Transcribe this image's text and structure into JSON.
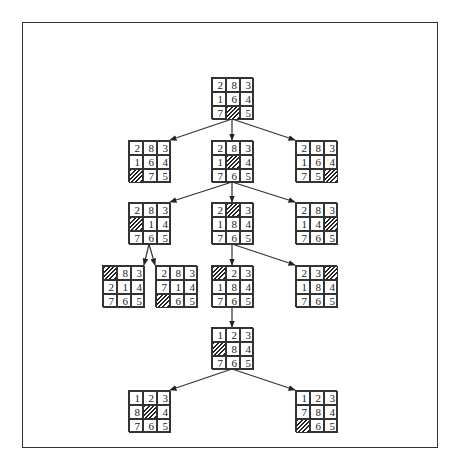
{
  "diagram": {
    "type": "search-tree",
    "blank_marker": "hatched",
    "nodes": [
      {
        "id": "n0",
        "x": 211,
        "y": 77,
        "cells": [
          "2",
          "8",
          "3",
          "1",
          "6",
          "4",
          "7",
          "",
          "5"
        ]
      },
      {
        "id": "n1a",
        "x": 128,
        "y": 140,
        "cells": [
          "2",
          "8",
          "3",
          "1",
          "6",
          "4",
          "",
          "7",
          "5"
        ]
      },
      {
        "id": "n1b",
        "x": 211,
        "y": 140,
        "cells": [
          "2",
          "8",
          "3",
          "1",
          "",
          "4",
          "7",
          "6",
          "5"
        ]
      },
      {
        "id": "n1c",
        "x": 295,
        "y": 140,
        "cells": [
          "2",
          "8",
          "3",
          "1",
          "6",
          "4",
          "7",
          "5",
          ""
        ]
      },
      {
        "id": "n2a",
        "x": 128,
        "y": 202,
        "cells": [
          "2",
          "8",
          "3",
          "",
          "1",
          "4",
          "7",
          "6",
          "5"
        ]
      },
      {
        "id": "n2b",
        "x": 211,
        "y": 202,
        "cells": [
          "2",
          "",
          "3",
          "1",
          "8",
          "4",
          "7",
          "6",
          "5"
        ]
      },
      {
        "id": "n2c",
        "x": 295,
        "y": 202,
        "cells": [
          "2",
          "8",
          "3",
          "1",
          "4",
          "",
          "7",
          "6",
          "5"
        ]
      },
      {
        "id": "n3a",
        "x": 102,
        "y": 265,
        "cells": [
          "",
          "8",
          "3",
          "2",
          "1",
          "4",
          "7",
          "6",
          "5"
        ]
      },
      {
        "id": "n3b",
        "x": 155,
        "y": 265,
        "cells": [
          "2",
          "8",
          "3",
          "7",
          "1",
          "4",
          "",
          "6",
          "5"
        ]
      },
      {
        "id": "n3c",
        "x": 211,
        "y": 265,
        "cells": [
          "",
          "2",
          "3",
          "1",
          "8",
          "4",
          "7",
          "6",
          "5"
        ]
      },
      {
        "id": "n3d",
        "x": 295,
        "y": 265,
        "cells": [
          "2",
          "3",
          "",
          "1",
          "8",
          "4",
          "7",
          "6",
          "5"
        ]
      },
      {
        "id": "n4",
        "x": 211,
        "y": 327,
        "cells": [
          "1",
          "2",
          "3",
          "",
          "8",
          "4",
          "7",
          "6",
          "5"
        ]
      },
      {
        "id": "n5a",
        "x": 128,
        "y": 390,
        "cells": [
          "1",
          "2",
          "3",
          "8",
          "",
          "4",
          "7",
          "6",
          "5"
        ]
      },
      {
        "id": "n5b",
        "x": 295,
        "y": 390,
        "cells": [
          "1",
          "2",
          "3",
          "7",
          "8",
          "4",
          "",
          "6",
          "5"
        ]
      }
    ],
    "edges": [
      {
        "from": "n0",
        "to": "n1a"
      },
      {
        "from": "n0",
        "to": "n1b"
      },
      {
        "from": "n0",
        "to": "n1c"
      },
      {
        "from": "n1b",
        "to": "n2a"
      },
      {
        "from": "n1b",
        "to": "n2b"
      },
      {
        "from": "n1b",
        "to": "n2c"
      },
      {
        "from": "n2a",
        "to": "n3a"
      },
      {
        "from": "n2a",
        "to": "n3b"
      },
      {
        "from": "n2b",
        "to": "n3c"
      },
      {
        "from": "n2b",
        "to": "n3d"
      },
      {
        "from": "n3c",
        "to": "n4"
      },
      {
        "from": "n4",
        "to": "n5a"
      },
      {
        "from": "n4",
        "to": "n5b"
      }
    ]
  },
  "colors": {
    "line": "#333333",
    "background": "#ffffff"
  }
}
